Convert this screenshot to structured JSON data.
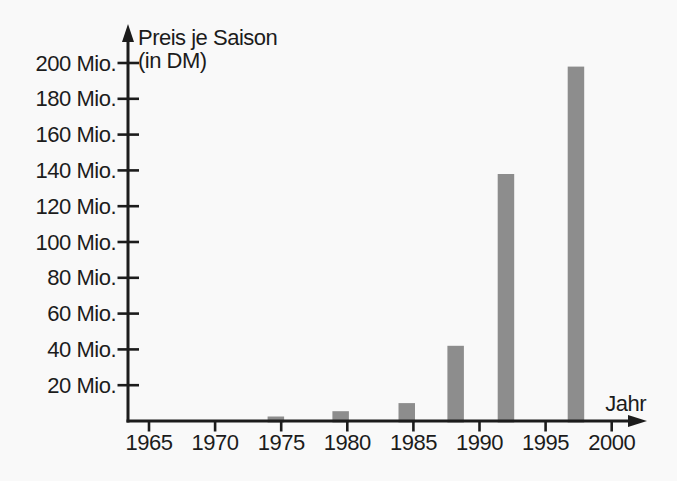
{
  "chart_data": {
    "type": "bar",
    "title": "Preis je Saison (in DM)",
    "title_lines": [
      "Preis je Saison",
      "(in DM)"
    ],
    "xlabel": "Jahr",
    "ylabel": "Preis je Saison (in DM)",
    "x_ticks": [
      1965,
      1970,
      1975,
      1980,
      1985,
      1990,
      1995,
      2000
    ],
    "y_ticks": [
      {
        "value": 20,
        "label": "20 Mio."
      },
      {
        "value": 40,
        "label": "40 Mio."
      },
      {
        "value": 60,
        "label": "60 Mio."
      },
      {
        "value": 80,
        "label": "80 Mio."
      },
      {
        "value": 100,
        "label": "100 Mio."
      },
      {
        "value": 120,
        "label": "120 Mio."
      },
      {
        "value": 140,
        "label": "140 Mio."
      },
      {
        "value": 160,
        "label": "160 Mio."
      },
      {
        "value": 180,
        "label": "180 Mio."
      },
      {
        "value": 200,
        "label": "200 Mio."
      }
    ],
    "bars": [
      {
        "x": 1974.6,
        "value": 2.5
      },
      {
        "x": 1979.5,
        "value": 5.5
      },
      {
        "x": 1984.5,
        "value": 10
      },
      {
        "x": 1988.2,
        "value": 42
      },
      {
        "x": 1992.0,
        "value": 138
      },
      {
        "x": 1997.3,
        "value": 198
      }
    ],
    "bar_width_years": 1.25,
    "xlim": [
      1963.4,
      2002.6
    ],
    "ylim": [
      0,
      222
    ],
    "grid": false,
    "legend": false,
    "colors": {
      "bar": "#8d8d8d",
      "axis": "#1c1c1c",
      "text": "#1c1c1c",
      "background": "#f9f9f9"
    }
  }
}
